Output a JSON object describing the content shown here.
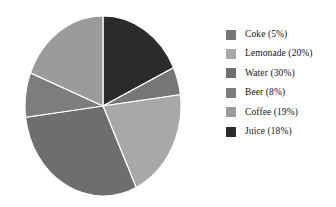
{
  "chart_data": {
    "type": "pie",
    "title": "",
    "categories": [
      "Coke",
      "Lemonade",
      "Water",
      "Beer",
      "Coffee",
      "Juice"
    ],
    "values": [
      5,
      20,
      30,
      8,
      19,
      18
    ],
    "value_unit": "percent",
    "legend_position": "right",
    "grid": false,
    "start_angle_deg": 0,
    "direction": "clockwise",
    "slice_order": [
      "Juice",
      "Coke",
      "Lemonade",
      "Water",
      "Beer",
      "Coffee"
    ],
    "colors": {
      "Coke": "#767676",
      "Lemonade": "#a8a8a8",
      "Water": "#6e6e6e",
      "Beer": "#7d7d7d",
      "Coffee": "#9b9b9b",
      "Juice": "#2b2b2b"
    },
    "slice_edge_color": "#ffffff",
    "background": "#ffffff",
    "slices": [
      {
        "label": "Coke",
        "value": 5,
        "color": "#767676",
        "legend_text": "Coke (5%)"
      },
      {
        "label": "Lemonade",
        "value": 20,
        "color": "#a8a8a8",
        "legend_text": "Lemonade (20%)"
      },
      {
        "label": "Water",
        "value": 30,
        "color": "#6e6e6e",
        "legend_text": "Water (30%)"
      },
      {
        "label": "Beer",
        "value": 8,
        "color": "#7d7d7d",
        "legend_text": "Beer (8%)"
      },
      {
        "label": "Coffee",
        "value": 19,
        "color": "#9b9b9b",
        "legend_text": "Coffee (19%)"
      },
      {
        "label": "Juice",
        "value": 18,
        "color": "#2b2b2b",
        "legend_text": "Juice (18%)"
      }
    ]
  },
  "legend": {
    "items": [
      {
        "label": "Coke (5%)",
        "color": "#767676",
        "swatch_name": "legend-swatch-coke"
      },
      {
        "label": "Lemonade (20%)",
        "color": "#a8a8a8",
        "swatch_name": "legend-swatch-lemonade"
      },
      {
        "label": "Water (30%)",
        "color": "#6e6e6e",
        "swatch_name": "legend-swatch-water"
      },
      {
        "label": "Beer (8%)",
        "color": "#7d7d7d",
        "swatch_name": "legend-swatch-beer"
      },
      {
        "label": "Coffee (19%)",
        "color": "#9b9b9b",
        "swatch_name": "legend-swatch-coffee"
      },
      {
        "label": "Juice (18%)",
        "color": "#2b2b2b",
        "swatch_name": "legend-swatch-juice"
      }
    ]
  }
}
